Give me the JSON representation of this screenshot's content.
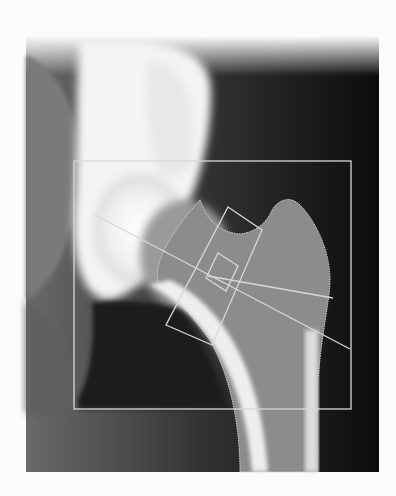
{
  "image": {
    "subject": "DXA hip bone densitometry scan (proximal femur)",
    "background_color": "#fbfbfb",
    "scan_area": {
      "x": 26,
      "y": 36,
      "width": 353,
      "height": 191
    },
    "roi_box": {
      "x": 74,
      "y": 161,
      "width": 277,
      "height": 248
    },
    "overlay_color": "#d8d8d8"
  }
}
